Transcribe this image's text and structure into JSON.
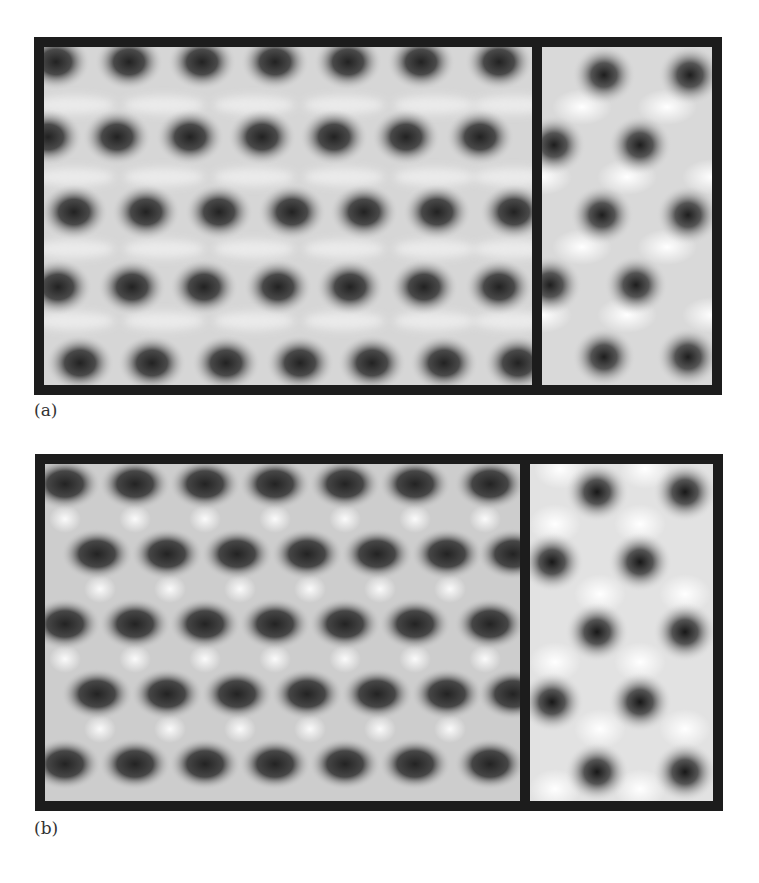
{
  "figure": {
    "panels": [
      {
        "label": "(a)",
        "left_image": {
          "description": "experimental HRTEM lattice image, oblique lattice of dark spots",
          "rows": 5,
          "cols": 7
        },
        "right_image": {
          "description": "simulated lattice image, hexagonal arrangement of dark spots",
          "rows": 5,
          "cols": 2
        }
      },
      {
        "label": "(b)",
        "left_image": {
          "description": "experimental HRTEM lattice image, rows of elongated dark spots",
          "rows": 5,
          "cols": 7
        },
        "right_image": {
          "description": "simulated lattice image, hexagonal arrangement of dark spots with bright interstitials",
          "rows": 5,
          "cols": 2
        }
      }
    ],
    "colors": {
      "frame": "#1c1c1c",
      "background": "#ffffff",
      "spot": "#2a2a2a",
      "bright": "#f4f4f4"
    }
  }
}
